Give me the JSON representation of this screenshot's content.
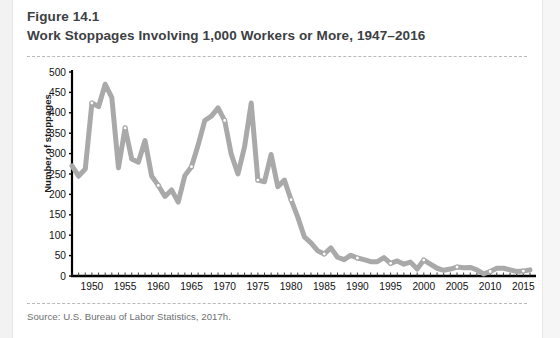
{
  "figure": {
    "label": "Figure 14.1",
    "title": "Work Stoppages Involving 1,000 Workers or More, 1947–2016",
    "source": "Source: U.S. Bureau of Labor Statistics, 2017h."
  },
  "colors": {
    "line": "#a9a9a9",
    "marker_fill": "#ffffff",
    "marker_stroke": "#a9a9a9",
    "axis": "#000000",
    "title_text": "#3c4043",
    "source_text": "#6c7072",
    "rule": "#b9b9b9",
    "page_background": "#ffffff"
  },
  "chart_data": {
    "type": "line",
    "title": "Work Stoppages Involving 1,000 Workers or More, 1947–2016",
    "xlabel": "",
    "ylabel": "Number of stoppages",
    "xlim": [
      1947,
      2016
    ],
    "ylim": [
      0,
      500
    ],
    "ytick_step": 50,
    "xtick_step": 5,
    "grid": false,
    "legend": false,
    "yticks": [
      0,
      50,
      100,
      150,
      200,
      250,
      300,
      350,
      400,
      450,
      500
    ],
    "ytick_labels": [
      "0",
      "50",
      "100",
      "150",
      "200",
      "250",
      "300",
      "350",
      "400",
      "450",
      "500"
    ],
    "xticks": [
      1950,
      1955,
      1960,
      1965,
      1970,
      1975,
      1980,
      1985,
      1990,
      1995,
      2000,
      2005,
      2010,
      2015
    ],
    "xtick_labels": [
      "1950",
      "1955",
      "1960",
      "1965",
      "1970",
      "1975",
      "1980",
      "1985",
      "1990",
      "1995",
      "2000",
      "2005",
      "2010",
      "2015"
    ],
    "series": [
      {
        "name": "Number of stoppages",
        "x": [
          1947,
          1948,
          1949,
          1950,
          1951,
          1952,
          1953,
          1954,
          1955,
          1956,
          1957,
          1958,
          1959,
          1960,
          1961,
          1962,
          1963,
          1964,
          1965,
          1966,
          1967,
          1968,
          1969,
          1970,
          1971,
          1972,
          1973,
          1974,
          1975,
          1976,
          1977,
          1978,
          1979,
          1980,
          1981,
          1982,
          1983,
          1984,
          1985,
          1986,
          1987,
          1988,
          1989,
          1990,
          1991,
          1992,
          1993,
          1994,
          1995,
          1996,
          1997,
          1998,
          1999,
          2000,
          2001,
          2002,
          2003,
          2004,
          2005,
          2006,
          2007,
          2008,
          2009,
          2010,
          2011,
          2012,
          2013,
          2014,
          2015,
          2016
        ],
        "values": [
          270,
          245,
          262,
          424,
          415,
          470,
          437,
          265,
          363,
          287,
          279,
          332,
          245,
          222,
          195,
          211,
          181,
          246,
          268,
          321,
          381,
          392,
          412,
          381,
          298,
          250,
          317,
          424,
          235,
          231,
          298,
          219,
          235,
          187,
          145,
          96,
          81,
          62,
          54,
          69,
          46,
          40,
          51,
          44,
          40,
          35,
          35,
          45,
          31,
          37,
          29,
          34,
          17,
          39,
          29,
          19,
          14,
          17,
          22,
          20,
          21,
          15,
          5,
          11,
          19,
          19,
          15,
          11,
          12,
          15
        ],
        "color": "#a9a9a9",
        "line_width": 5,
        "markers_at": [
          1950,
          1955,
          1960,
          1965,
          1970,
          1975,
          1980,
          1985,
          1990,
          1995,
          2000,
          2005,
          2010,
          2015
        ],
        "marker_style": "open-circle"
      }
    ]
  }
}
